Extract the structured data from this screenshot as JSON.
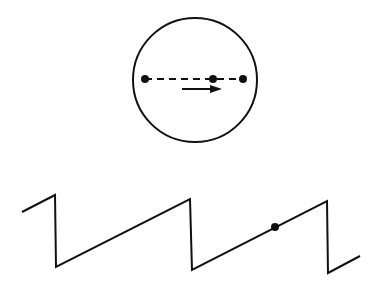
{
  "diagram": {
    "colors": {
      "stroke": "#111111",
      "background": "#ffffff"
    },
    "circle": {
      "cx": 195,
      "cy": 80,
      "r": 62
    },
    "diameter": {
      "x1": 145,
      "x2": 243,
      "y": 79,
      "style": "dashed"
    },
    "points": [
      {
        "name": "left-end",
        "x": 145,
        "y": 79
      },
      {
        "name": "moving-point",
        "x": 213,
        "y": 79
      },
      {
        "name": "right-end",
        "x": 243,
        "y": 79
      }
    ],
    "arrow": {
      "x1": 182,
      "x2": 222,
      "y": 89,
      "direction": "right"
    },
    "sawtooth": {
      "path": [
        [
          22,
          212
        ],
        [
          55,
          195
        ],
        [
          56,
          267
        ],
        [
          190,
          199
        ],
        [
          192,
          270
        ],
        [
          327,
          201
        ],
        [
          328,
          273
        ],
        [
          360,
          256
        ]
      ],
      "marker": {
        "x": 275,
        "y": 227
      }
    }
  }
}
